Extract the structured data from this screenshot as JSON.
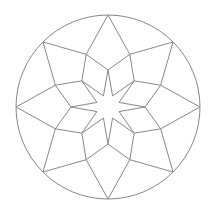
{
  "diagram": {
    "type": "eight-fold star mandala",
    "canvas": {
      "width": 213,
      "height": 207
    },
    "center": [
      108,
      107
    ],
    "circle_radius": 92,
    "symmetry": 8,
    "outer_vertex_radius": 92,
    "mid_vertex_radius": 57,
    "inner_vertex_radius": 37,
    "star_inner_radius": 12,
    "stroke_color": "#888888",
    "background_color": "#ffffff",
    "stroke_width": 1
  }
}
